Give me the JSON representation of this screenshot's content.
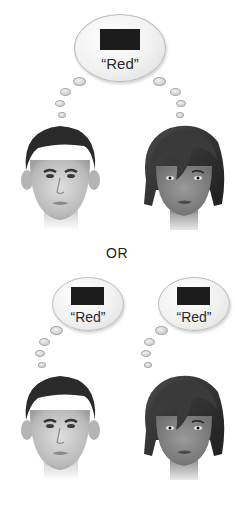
{
  "figure": {
    "top_bubble": {
      "label": "“Red”",
      "swatch_color": "#1c1c1c"
    },
    "separator": "OR",
    "bottom_left_bubble": {
      "label": "“Red”",
      "swatch_color": "#1c1c1c"
    },
    "bottom_right_bubble": {
      "label": "“Red”",
      "swatch_color": "#1c1c1c"
    },
    "people": [
      {
        "id": "man-top",
        "description": "male face, short dark hair"
      },
      {
        "id": "woman-top",
        "description": "female face, dark bob hair with bangs"
      },
      {
        "id": "man-bottom",
        "description": "male face, short dark hair"
      },
      {
        "id": "woman-bottom",
        "description": "female face, dark bob hair with bangs"
      }
    ]
  }
}
